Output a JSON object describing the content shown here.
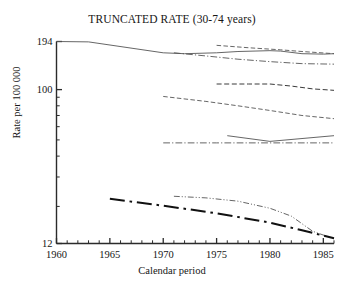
{
  "chart_data": {
    "type": "line",
    "title": "TRUNCATED RATE (30-74 years)",
    "xlabel": "Calendar period",
    "ylabel": "Rate per 100 000",
    "yscale": "log",
    "ylim": [
      12,
      194
    ],
    "xlim": [
      1960,
      1986
    ],
    "ytick_labels": [
      "194",
      "100",
      "12"
    ],
    "ytick_values": [
      194,
      100,
      12
    ],
    "xtick_labels": [
      "1960",
      "1965",
      "1970",
      "1975",
      "1980",
      "1985"
    ],
    "xtick_values": [
      1960,
      1965,
      1970,
      1975,
      1980,
      1985
    ],
    "xminor_step": 1,
    "grid": false,
    "legend": "none",
    "series": [
      {
        "name": "series-1-solid-top",
        "style": "solid",
        "width": 0.9,
        "color": "#555555",
        "x": [
          1960,
          1963,
          1970,
          1972,
          1975,
          1977,
          1980,
          1981,
          1983,
          1985,
          1986
        ],
        "y": [
          194,
          193,
          166,
          164,
          166,
          169,
          171,
          170,
          164,
          163,
          164
        ]
      },
      {
        "name": "series-2-dashdot-upper",
        "style": "dashdot",
        "width": 0.9,
        "color": "#555555",
        "x": [
          1971,
          1974,
          1977,
          1980,
          1983,
          1986
        ],
        "y": [
          166,
          159,
          152,
          147,
          143,
          142
        ]
      },
      {
        "name": "series-3-dashed-top-right",
        "style": "dashed",
        "width": 0.9,
        "color": "#555555",
        "x": [
          1975,
          1978,
          1981,
          1983,
          1986
        ],
        "y": [
          184,
          178,
          173,
          169,
          164
        ]
      },
      {
        "name": "series-4-dashed-mid",
        "style": "dashed",
        "width": 1.0,
        "color": "#3a3a3a",
        "x": [
          1975,
          1978,
          1980,
          1982,
          1984,
          1986
        ],
        "y": [
          108,
          108,
          108,
          105,
          101,
          99
        ]
      },
      {
        "name": "series-5-dashed-lower-mid",
        "style": "dashed",
        "width": 0.9,
        "color": "#555555",
        "x": [
          1970,
          1974,
          1977,
          1980,
          1983,
          1986
        ],
        "y": [
          91,
          85,
          80,
          75,
          70,
          67
        ]
      },
      {
        "name": "series-6-solid-v",
        "style": "solid",
        "width": 0.9,
        "color": "#555555",
        "x": [
          1976,
          1980,
          1986
        ],
        "y": [
          53,
          49,
          53
        ]
      },
      {
        "name": "series-7-dashdot-flat",
        "style": "dashdot",
        "width": 0.9,
        "color": "#555555",
        "x": [
          1970,
          1975,
          1980,
          1983,
          1986
        ],
        "y": [
          48,
          48,
          48,
          48,
          48
        ]
      },
      {
        "name": "series-8-dashdotdot-light",
        "style": "dashdotdot",
        "width": 0.9,
        "color": "#555555",
        "x": [
          1971,
          1974,
          1977,
          1980,
          1982,
          1984,
          1986
        ],
        "y": [
          23,
          22.5,
          21.5,
          19.5,
          17.5,
          14.2,
          12.8
        ]
      },
      {
        "name": "series-9-dashdot-thick",
        "style": "dashdot",
        "width": 2.0,
        "color": "#111111",
        "x": [
          1965,
          1970,
          1975,
          1980,
          1983,
          1986
        ],
        "y": [
          22.2,
          20.2,
          18.2,
          16.0,
          14.4,
          12.9
        ]
      }
    ]
  },
  "axes": {
    "y_top_label": "194",
    "y_mid_label": "100",
    "y_bottom_label": "12"
  }
}
